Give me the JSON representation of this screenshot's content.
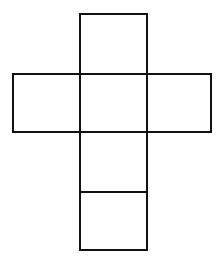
{
  "diagram": {
    "type": "cube-net",
    "stroke_color": "#111111",
    "background": "#ffffff",
    "stroke_width": 2,
    "faces": [
      {
        "id": "top",
        "x": 80,
        "y": 14,
        "w": 67,
        "h": 60
      },
      {
        "id": "left",
        "x": 13,
        "y": 74,
        "w": 67,
        "h": 58
      },
      {
        "id": "center",
        "x": 80,
        "y": 74,
        "w": 67,
        "h": 58
      },
      {
        "id": "right",
        "x": 147,
        "y": 74,
        "w": 64,
        "h": 58
      },
      {
        "id": "lower",
        "x": 80,
        "y": 132,
        "w": 67,
        "h": 60
      },
      {
        "id": "bottom",
        "x": 80,
        "y": 192,
        "w": 67,
        "h": 58
      }
    ]
  }
}
